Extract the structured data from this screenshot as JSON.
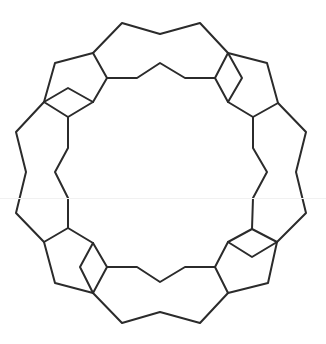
{
  "diagram": {
    "type": "line-drawing",
    "stroke_color": "#2b2b2b",
    "background_color": "#ffffff",
    "paths": [
      {
        "name": "outer-top-arc",
        "points": "93,53 122,23 160,34 200,23 228,53"
      },
      {
        "name": "inner-top-arc",
        "points": "107,78 137,78 160,63 185,78 215,78"
      },
      {
        "name": "outer-left-arc",
        "points": "44,102 16,132 26,172 16,213 44,242"
      },
      {
        "name": "inner-left-arc",
        "points": "68,117 68,148 55,172 68,198 68,228"
      },
      {
        "name": "outer-bottom-arc",
        "points": "93,293 122,323 160,312 200,323 228,293"
      },
      {
        "name": "inner-bottom-arc",
        "points": "107,267 137,267 160,282 185,267 215,267"
      },
      {
        "name": "outer-right-arc",
        "points": "278,103 306,132 296,172 306,213 277,242"
      },
      {
        "name": "inner-right-arc",
        "points": "253,117 253,148 267,172 253,198 252,229"
      },
      {
        "name": "tl-rhombus",
        "points": "44,102 68,88 93,102 68,117 44,102"
      },
      {
        "name": "tl-pentagon-a",
        "points": "93,53 55,63 44,102"
      },
      {
        "name": "tl-pentagon-b",
        "points": "93,53 107,78 93,102"
      },
      {
        "name": "tr-rhombus",
        "points": "228,53 242,78 228,102 215,78 228,53"
      },
      {
        "name": "tr-pentagon-a",
        "points": "228,53 267,63 278,103 253,117 228,102"
      },
      {
        "name": "br-rhombus",
        "points": "228,242 252,229 277,242 252,257 228,242"
      },
      {
        "name": "br-pentagon-a",
        "points": "277,242 268,283 228,293 215,267 228,242"
      },
      {
        "name": "bl-rhombus",
        "points": "93,243 107,267 93,293 80,267 93,243"
      },
      {
        "name": "bl-pentagon-a",
        "points": "68,228 44,242 55,283 93,293"
      },
      {
        "name": "bl-pentagon-b",
        "points": "68,228 93,243"
      }
    ]
  }
}
